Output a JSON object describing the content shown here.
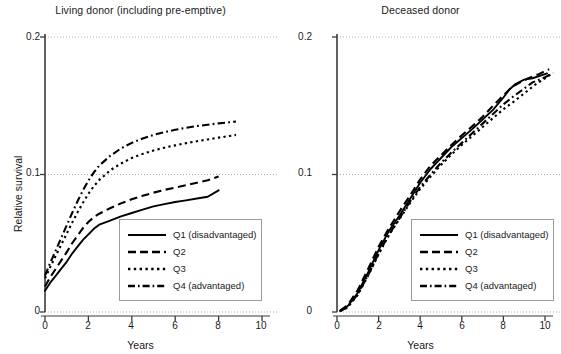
{
  "figure": {
    "panels": [
      {
        "id": "living-donor",
        "title": "Living donor (including pre-emptive)",
        "xlabel": "Years",
        "ylabel": "Relative survival"
      },
      {
        "id": "deceased-donor",
        "title": "Deceased donor",
        "xlabel": "Years",
        "ylabel": "Cumulative incidence"
      }
    ],
    "legend": {
      "entries": [
        {
          "label": "Q1 (disadvantaged)",
          "style": "solid"
        },
        {
          "label": "Q2",
          "style": "dashed"
        },
        {
          "label": "Q3",
          "style": "dotted"
        },
        {
          "label": "Q4 (advantaged)",
          "style": "dashdot"
        }
      ]
    },
    "colors": {
      "line": "#000000",
      "axis": "#3a3a3a",
      "grid": "#9a9a9a",
      "legend_border": "#9a9a9a",
      "background": "#ffffff"
    },
    "xticks": [
      "0",
      "2",
      "4",
      "6",
      "8",
      "10"
    ],
    "yticks": [
      "0",
      "0.1",
      "0.2"
    ]
  },
  "chart_data": [
    {
      "type": "line",
      "title": "Living donor (including pre-emptive)",
      "xlabel": "Years",
      "ylabel": "Relative survival",
      "xlim": [
        0,
        10
      ],
      "ylim": [
        0,
        0.2
      ],
      "xticks": [
        0,
        2,
        4,
        6,
        8,
        10
      ],
      "yticks": [
        0,
        0.1,
        0.2
      ],
      "grid": "horizontal-dotted",
      "legend_position": "bottom-right",
      "series": [
        {
          "name": "Q1 (disadvantaged)",
          "style": "solid",
          "x": [
            0,
            0.25,
            0.5,
            0.75,
            1,
            1.25,
            1.5,
            1.75,
            2,
            2.25,
            2.5,
            3,
            3.5,
            4,
            4.5,
            5,
            5.5,
            6,
            6.5,
            7,
            7.5,
            8
          ],
          "y": [
            0.0155,
            0.0215,
            0.0265,
            0.0315,
            0.0365,
            0.0425,
            0.0475,
            0.0525,
            0.0565,
            0.0605,
            0.0635,
            0.0665,
            0.0695,
            0.072,
            0.0745,
            0.0768,
            0.0785,
            0.08,
            0.0812,
            0.0825,
            0.0838,
            0.0885
          ]
        },
        {
          "name": "Q2",
          "style": "dashed",
          "x": [
            0,
            0.25,
            0.5,
            0.75,
            1,
            1.25,
            1.5,
            1.75,
            2,
            2.25,
            2.5,
            3,
            3.5,
            4,
            4.5,
            5,
            5.5,
            6,
            6.5,
            7,
            7.5,
            8
          ],
          "y": [
            0.0185,
            0.0255,
            0.0315,
            0.0375,
            0.0435,
            0.05,
            0.0555,
            0.061,
            0.0655,
            0.069,
            0.0715,
            0.0755,
            0.079,
            0.082,
            0.0845,
            0.0868,
            0.0888,
            0.0905,
            0.0922,
            0.094,
            0.0958,
            0.0985
          ]
        },
        {
          "name": "Q3",
          "style": "dotted",
          "x": [
            0,
            0.25,
            0.5,
            0.75,
            1,
            1.25,
            1.5,
            1.75,
            2,
            2.25,
            2.5,
            3,
            3.5,
            4,
            4.5,
            5,
            5.5,
            6,
            6.5,
            7,
            7.5,
            8,
            8.5,
            8.8
          ],
          "y": [
            0.0245,
            0.033,
            0.041,
            0.049,
            0.057,
            0.065,
            0.0725,
            0.0795,
            0.086,
            0.0915,
            0.096,
            0.103,
            0.108,
            0.112,
            0.115,
            0.1175,
            0.1195,
            0.1212,
            0.1228,
            0.1242,
            0.1255,
            0.1268,
            0.128,
            0.1288
          ]
        },
        {
          "name": "Q4 (advantaged)",
          "style": "dashdot",
          "x": [
            0,
            0.25,
            0.5,
            0.75,
            1,
            1.25,
            1.5,
            1.75,
            2,
            2.25,
            2.5,
            3,
            3.5,
            4,
            4.5,
            5,
            5.5,
            6,
            6.5,
            7,
            7.5,
            8,
            8.5,
            8.8
          ],
          "y": [
            0.0265,
            0.036,
            0.045,
            0.054,
            0.063,
            0.072,
            0.0805,
            0.0885,
            0.0955,
            0.1015,
            0.1065,
            0.1135,
            0.119,
            0.123,
            0.1262,
            0.1288,
            0.1308,
            0.1325,
            0.134,
            0.1352,
            0.1362,
            0.1372,
            0.138,
            0.1385
          ]
        }
      ]
    },
    {
      "type": "line",
      "title": "Deceased donor",
      "xlabel": "Years",
      "ylabel": "Cumulative incidence",
      "xlim": [
        0,
        10
      ],
      "ylim": [
        0,
        0.2
      ],
      "xticks": [
        0,
        2,
        4,
        6,
        8,
        10
      ],
      "yticks": [
        0,
        0.1,
        0.2
      ],
      "grid": "horizontal-dotted",
      "legend_position": "bottom-right",
      "series": [
        {
          "name": "Q1 (disadvantaged)",
          "style": "solid",
          "x": [
            0.15,
            0.5,
            1,
            1.5,
            2,
            2.5,
            3,
            3.5,
            4,
            4.5,
            5,
            5.5,
            6,
            6.5,
            7,
            7.5,
            8,
            8.3,
            8.6,
            9,
            9.4,
            10.1
          ],
          "y": [
            0.0008,
            0.004,
            0.014,
            0.029,
            0.045,
            0.059,
            0.07,
            0.082,
            0.094,
            0.104,
            0.112,
            0.12,
            0.1265,
            0.133,
            0.14,
            0.147,
            0.156,
            0.162,
            0.166,
            0.169,
            0.17,
            0.1735
          ]
        },
        {
          "name": "Q2",
          "style": "dashed",
          "x": [
            0.15,
            0.5,
            1,
            1.5,
            2,
            2.5,
            3,
            3.5,
            4,
            4.5,
            5,
            5.5,
            6,
            6.5,
            7,
            7.5,
            8,
            8.4,
            8.8,
            9.2,
            9.7,
            10.2
          ],
          "y": [
            0.001,
            0.0048,
            0.016,
            0.0315,
            0.0475,
            0.061,
            0.073,
            0.0845,
            0.0965,
            0.1065,
            0.114,
            0.1215,
            0.1285,
            0.135,
            0.142,
            0.15,
            0.1575,
            0.1635,
            0.167,
            0.17,
            0.173,
            0.1765
          ]
        },
        {
          "name": "Q3",
          "style": "dotted",
          "x": [
            0.15,
            0.5,
            1,
            1.5,
            2,
            2.5,
            3,
            3.5,
            4,
            4.5,
            5,
            5.5,
            6,
            6.5,
            7,
            7.5,
            8,
            8.5,
            9,
            9.5,
            10,
            10.4
          ],
          "y": [
            0.0006,
            0.0032,
            0.0125,
            0.0265,
            0.042,
            0.056,
            0.0675,
            0.079,
            0.0895,
            0.0985,
            0.107,
            0.1145,
            0.1215,
            0.128,
            0.1345,
            0.141,
            0.1475,
            0.153,
            0.159,
            0.165,
            0.17,
            0.174
          ]
        },
        {
          "name": "Q4 (advantaged)",
          "style": "dashdot",
          "x": [
            0.15,
            0.5,
            1,
            1.5,
            2,
            2.5,
            3,
            3.5,
            4,
            4.5,
            5,
            5.5,
            6,
            6.5,
            7,
            7.5,
            8,
            8.5,
            9,
            9.4,
            9.9,
            10.3
          ],
          "y": [
            0.0006,
            0.0035,
            0.013,
            0.027,
            0.0425,
            0.0565,
            0.068,
            0.08,
            0.091,
            0.1,
            0.1085,
            0.116,
            0.123,
            0.13,
            0.137,
            0.144,
            0.151,
            0.157,
            0.1625,
            0.167,
            0.17,
            0.173
          ]
        }
      ]
    }
  ]
}
